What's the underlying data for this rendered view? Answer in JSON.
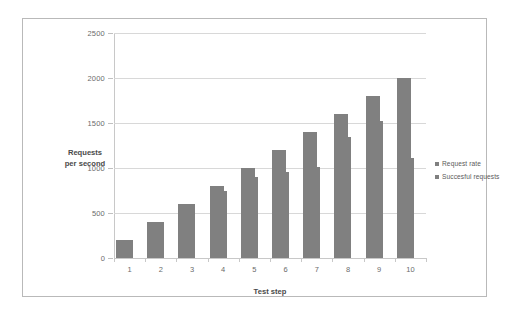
{
  "chart_data": {
    "type": "bar",
    "title": "",
    "subtitle": "",
    "xlabel": "Test step",
    "ylabel": "Requests per second",
    "ylabel_lines": [
      "Requests",
      "per second"
    ],
    "categories": [
      "1",
      "2",
      "3",
      "4",
      "5",
      "6",
      "7",
      "8",
      "9",
      "10"
    ],
    "series": [
      {
        "name": "Request rate",
        "color": "#808080",
        "values": [
          200,
          400,
          600,
          800,
          1000,
          1200,
          1400,
          1600,
          1800,
          2000
        ]
      },
      {
        "name": "Succesful requests",
        "color": "#808080",
        "values": [
          200,
          400,
          600,
          750,
          900,
          960,
          1010,
          1340,
          1520,
          1110
        ]
      }
    ],
    "ylim": [
      0,
      2500
    ],
    "ytick_values": [
      0,
      500,
      1000,
      1500,
      2000,
      2500
    ],
    "ytick_labels": [
      "0",
      "500",
      "1000",
      "1500",
      "2000",
      "2500"
    ],
    "grid": true,
    "grid_axis": "y",
    "legend_position": "right",
    "bar_overlap": true
  },
  "axes": {
    "y_title_lines": [
      "Requests",
      "per second"
    ],
    "x_title": "Test step"
  },
  "legend": {
    "items": [
      {
        "label": "Request rate"
      },
      {
        "label": "Succesful requests"
      }
    ]
  },
  "colors": {
    "bar": "#808080",
    "gridline": "#d8d8d8",
    "axis": "#c8c8c8",
    "frame": "#b9b9b9",
    "tick_text": "#6b6b6b",
    "title_text": "#4a4a4a",
    "background": "#ffffff"
  }
}
